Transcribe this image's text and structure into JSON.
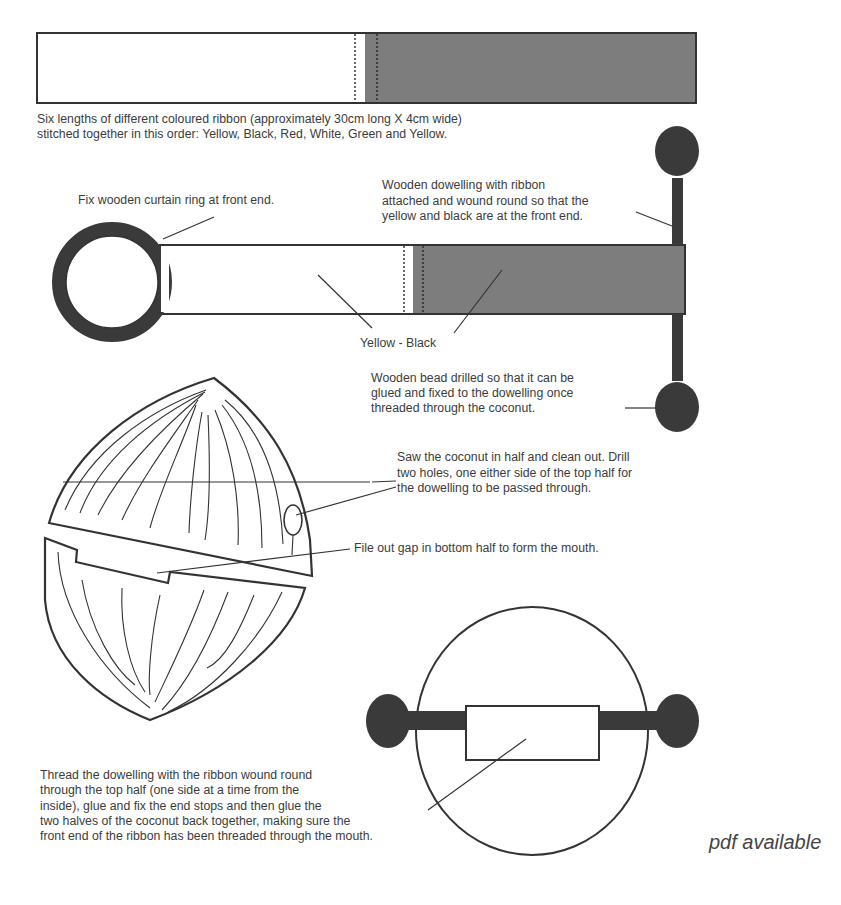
{
  "diagram": {
    "colors": {
      "ink": "#333333",
      "ribbon_dark": "#7a7a7a",
      "bead": "#3a3a3a",
      "background": "#ffffff"
    },
    "ribbon_order": [
      "Yellow",
      "Black",
      "Red",
      "White",
      "Green",
      "Yellow"
    ],
    "labels": {
      "ribbon_desc": [
        "Six lengths of different coloured ribbon (approximately 30cm long X 4cm wide)",
        "stitched together in this order: Yellow, Black, Red, White, Green and Yellow."
      ],
      "curtain_ring": [
        "Fix wooden curtain ring at front end."
      ],
      "dowelling": [
        "Wooden dowelling with ribbon",
        "attached and wound round so that the",
        "yellow and black are at the front end."
      ],
      "yellow_black": [
        "Yellow - Black"
      ],
      "bead": [
        "Wooden bead drilled so that it can be",
        "glued and fixed to the dowelling once",
        "threaded through the coconut."
      ],
      "saw": [
        "Saw the coconut in half and clean out. Drill",
        "two holes, one either side of the top half for",
        "the dowelling to be passed through."
      ],
      "file_gap": [
        "File out gap in bottom half to form the mouth."
      ],
      "thread": [
        "Thread the dowelling with the ribbon wound round",
        "through the top half (one side at a time from the",
        "inside), glue and fix the end stops and then glue the",
        "two halves of the coconut back together, making sure the",
        "front end of the ribbon has been threaded through the mouth."
      ]
    },
    "footer": {
      "pdf_note": "pdf available"
    }
  }
}
